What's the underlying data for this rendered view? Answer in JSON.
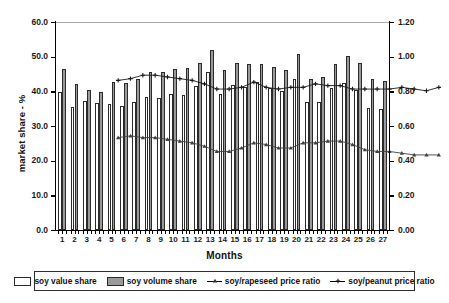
{
  "chart_data": {
    "type": "bar",
    "title": "",
    "xlabel": "Months",
    "ylabel": "market share - %",
    "y2label": "",
    "ylim": [
      0.0,
      60.0
    ],
    "y2lim": [
      0.0,
      1.2
    ],
    "ytick_step": 10.0,
    "y2tick_step": 0.2,
    "grid": false,
    "legend_position": "bottom",
    "categories": [
      "1",
      "2",
      "3",
      "4",
      "5",
      "6",
      "7",
      "8",
      "9",
      "10",
      "11",
      "12",
      "13",
      "14",
      "15",
      "16",
      "17",
      "18",
      "19",
      "20",
      "21",
      "22",
      "23",
      "24",
      "25",
      "26",
      "27"
    ],
    "yticks": [
      "0.0",
      "10.0",
      "20.0",
      "30.0",
      "40.0",
      "50.0",
      "60.0"
    ],
    "y2ticks": [
      "0.00",
      "0.20",
      "0.40",
      "0.60",
      "0.80",
      "1.00",
      "1.20"
    ],
    "series": [
      {
        "name": "soy value share",
        "type": "bar",
        "axis": "left",
        "color": "#ffffff",
        "edge": "#2b2b2b",
        "values": [
          39.8,
          35.6,
          37.2,
          36.5,
          36.3,
          35.7,
          36.9,
          38.5,
          38.1,
          39.1,
          38.9,
          41.4,
          45.5,
          39.1,
          41.7,
          41.3,
          42.8,
          41.1,
          40.0,
          43.5,
          36.8,
          36.9,
          41.1,
          42.4,
          40.5,
          35.3,
          34.8
        ]
      },
      {
        "name": "soy volume share",
        "type": "bar",
        "axis": "left",
        "color": "#9a9a9a",
        "edge": "#2b2b2b",
        "values": [
          46.5,
          42.0,
          40.4,
          39.7,
          42.6,
          42.4,
          43.6,
          45.5,
          45.7,
          46.5,
          46.7,
          48.2,
          51.9,
          46.3,
          48.3,
          47.8,
          48.0,
          47.1,
          46.1,
          50.9,
          43.5,
          44.1,
          48.0,
          50.2,
          48.2,
          43.6,
          42.9
        ]
      },
      {
        "name": "soy/rapeseed price ratio",
        "type": "line",
        "axis": "right",
        "marker": "triangle",
        "color": "#404040",
        "values": [
          0.66,
          0.67,
          0.66,
          0.66,
          0.65,
          0.64,
          0.63,
          0.61,
          0.58,
          0.58,
          0.6,
          0.63,
          0.62,
          0.6,
          0.6,
          0.63,
          0.63,
          0.64,
          0.64,
          0.62,
          0.59,
          0.58,
          0.58,
          0.57,
          0.56,
          0.56,
          0.56
        ]
      },
      {
        "name": "soy/peanut price ratio",
        "type": "line",
        "axis": "right",
        "marker": "plus",
        "color": "#1a1a1a",
        "values": [
          0.99,
          1.0,
          1.02,
          1.02,
          1.01,
          1.0,
          0.99,
          0.97,
          0.94,
          0.94,
          0.95,
          0.98,
          0.95,
          0.94,
          0.95,
          0.95,
          0.97,
          0.96,
          0.96,
          0.94,
          0.94,
          0.94,
          0.94,
          0.95,
          0.94,
          0.93,
          0.95
        ]
      }
    ]
  },
  "legend": {
    "items": [
      {
        "label": "soy value share",
        "kind": "swatch-white"
      },
      {
        "label": "soy volume share",
        "kind": "swatch-gray"
      },
      {
        "label": "soy/rapeseed price ratio",
        "kind": "line-triangle"
      },
      {
        "label": "soy/peanut price ratio",
        "kind": "line-plus"
      }
    ]
  }
}
